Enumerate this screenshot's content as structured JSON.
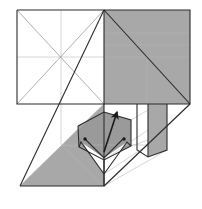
{
  "figure": {
    "type": "line-drawing",
    "caption": "",
    "canvas": {
      "width": 202,
      "height": 209
    },
    "colors": {
      "background": "#ffffff",
      "shaded_fill": "#a8a8a8",
      "shaded_fill_dark": "#9a9a9a",
      "shaded_fill_light": "#bdbdbd",
      "white_fill": "#ffffff",
      "outline": "#2b2b2b",
      "crease_line": "#8c8c8c",
      "faint_line": "#b5b5b5",
      "arrow": "#1a1a1a",
      "dot": "#1a1a1a"
    },
    "stroke_widths": {
      "outline": 1.1,
      "crease": 0.7,
      "faint": 0.55,
      "arrow": 1.6
    },
    "regions": [
      {
        "name": "left-square-panel",
        "fill": "white",
        "note": "upper-left square with X diagonals and centre cross"
      },
      {
        "name": "right-square-panel",
        "fill": "shaded",
        "note": "upper-right square with X diagonals and horizontal creases"
      },
      {
        "name": "lower-left-flap",
        "fill": "shaded",
        "note": "large triangular flap sweeping to lower-left vertex"
      },
      {
        "name": "right-tab-panel",
        "fill": "shaded",
        "note": "narrow vertical tab descending on the right"
      },
      {
        "name": "centre-pocket",
        "fill": "mixed",
        "note": "central folded claw/pocket detail"
      },
      {
        "name": "base-platform",
        "fill": "white",
        "note": "lower white parallelogram base"
      }
    ],
    "markers": {
      "arrow": {
        "name": "fold-direction-arrow",
        "from": [
          104,
          152
        ],
        "to": [
          117,
          112
        ],
        "label": ""
      },
      "dots": [
        {
          "name": "reference-dot-left",
          "x": 85,
          "y": 139
        },
        {
          "name": "reference-dot-right",
          "x": 124,
          "y": 139
        }
      ]
    }
  }
}
